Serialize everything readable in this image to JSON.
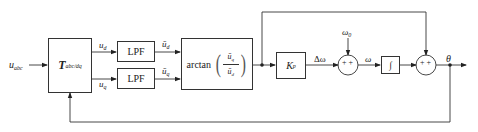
{
  "diagram": {
    "type": "PLL block diagram",
    "input": {
      "symbol": "u",
      "subscript": "abc"
    },
    "blocks": {
      "transform": {
        "symbol": "T",
        "subscript": "abc/dq"
      },
      "lpf_d": {
        "label": "LPF"
      },
      "lpf_q": {
        "label": "LPF"
      },
      "arctan": {
        "func": "arctan",
        "numerator": "ū",
        "numerator_sub": "q",
        "denominator": "ū",
        "denominator_sub": "d"
      },
      "gain": {
        "symbol": "K",
        "subscript": "p"
      },
      "integrator": {
        "symbol": "∫"
      }
    },
    "signals": {
      "ud": {
        "symbol": "u",
        "subscript": "d"
      },
      "uq": {
        "symbol": "u",
        "subscript": "q"
      },
      "ud_bar": {
        "symbol": "ū",
        "subscript": "d"
      },
      "uq_bar": {
        "symbol": "ū",
        "subscript": "q"
      },
      "delta_omega": "Δω",
      "omega0": {
        "symbol": "ω",
        "subscript": "0"
      },
      "omega": "ω",
      "theta": "θ"
    },
    "sums": {
      "sum1": {
        "signs": "+ +"
      },
      "sum2": {
        "signs": "+ +"
      }
    },
    "colors": {
      "line": "#333333",
      "text": "#222222",
      "background": "#ffffff"
    }
  }
}
